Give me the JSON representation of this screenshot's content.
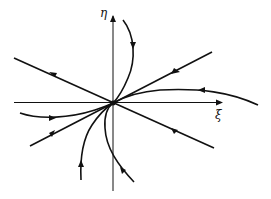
{
  "figure": {
    "type": "phase-portrait",
    "axes": {
      "horizontal_label": "ξ",
      "vertical_label": "η"
    },
    "stroke_color": "#111111",
    "background": "#ffffff"
  }
}
